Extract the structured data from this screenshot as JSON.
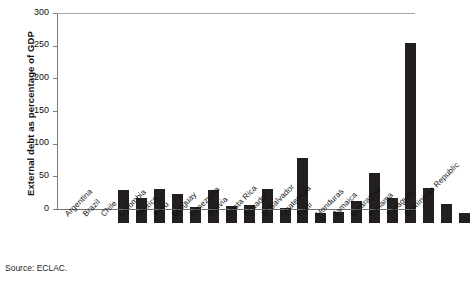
{
  "chart_data": {
    "type": "bar",
    "title": "",
    "subtitle": "",
    "xlabel": "",
    "ylabel": "External debt as percentage of GDP",
    "ylim": [
      0,
      300
    ],
    "yticks": [
      0,
      50,
      100,
      150,
      200,
      250,
      300
    ],
    "grid": false,
    "legend": null,
    "bar_color": "#231f20",
    "categories": [
      "Argentina",
      "Brazil",
      "Chile",
      "Colombia",
      "Mexico",
      "Peru",
      "Uruguay",
      "Venezuela",
      "Bolivia",
      "Costa Rica",
      "Ecuador",
      "El Salvador",
      "Guatemala",
      "Haiti",
      "Honduras",
      "Jamaica",
      "Nicaragua",
      "Panama",
      "Paraguay",
      "Dominican Republic"
    ],
    "values": [
      51,
      39,
      52,
      45,
      25,
      51,
      26,
      27,
      52,
      23,
      99,
      16,
      17,
      33,
      77,
      39,
      276,
      54,
      29,
      16
    ]
  },
  "source": {
    "label": "Source: ECLAC."
  }
}
